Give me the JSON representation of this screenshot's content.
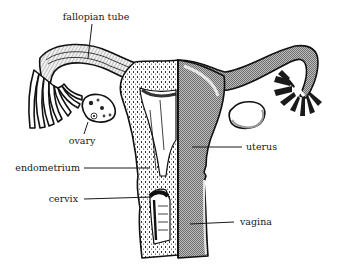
{
  "figure": {
    "colors": {
      "ink": "#111111",
      "background": "#ffffff",
      "hatch_gray": "#8c8c8c",
      "light_gray": "#d9d9d9"
    }
  },
  "labels": [
    {
      "id": "fallopian_tube",
      "text": "fallopian tube"
    },
    {
      "id": "ovary",
      "text": "ovary"
    },
    {
      "id": "endometrium",
      "text": "endometrium"
    },
    {
      "id": "cervix",
      "text": "cervix"
    },
    {
      "id": "uterus",
      "text": "uterus"
    },
    {
      "id": "vagina",
      "text": "vagina"
    }
  ]
}
